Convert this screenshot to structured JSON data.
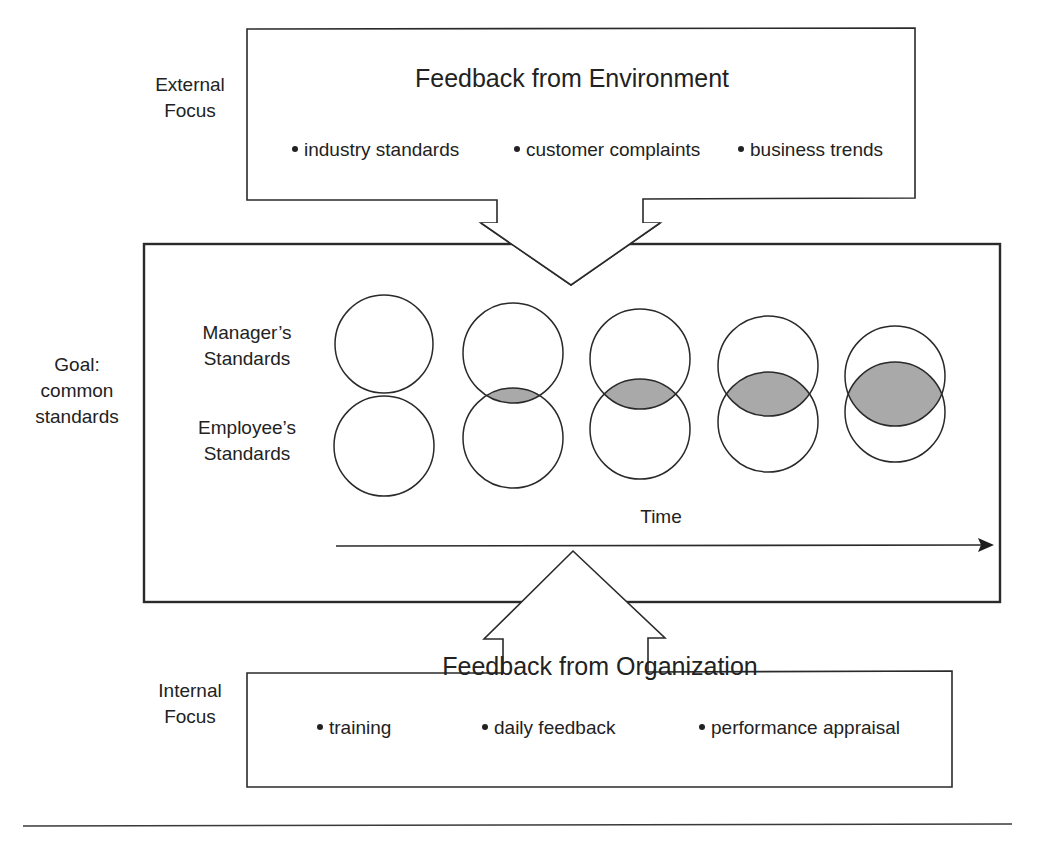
{
  "external": {
    "side_label_line1": "External",
    "side_label_line2": "Focus",
    "title": "Feedback from Environment",
    "bullets": [
      "industry standards",
      "customer complaints",
      "business trends"
    ]
  },
  "center": {
    "side_label_line1": "Goal:",
    "side_label_line2": "common",
    "side_label_line3": "standards",
    "row_labels": {
      "manager_line1": "Manager’s",
      "manager_line2": "Standards",
      "employee_line1": "Employee’s",
      "employee_line2": "Standards"
    },
    "time_label": "Time",
    "overlap_stages": 5
  },
  "internal": {
    "side_label_line1": "Internal",
    "side_label_line2": "Focus",
    "title": "Feedback from Organization",
    "bullets": [
      "training",
      "daily feedback",
      "performance appraisal"
    ]
  },
  "colors": {
    "stroke": "#2a2a2a",
    "overlap_fill": "#a9a9a9",
    "background": "#ffffff"
  }
}
